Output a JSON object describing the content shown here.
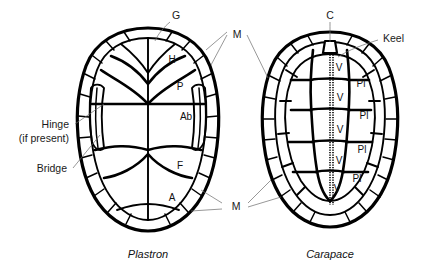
{
  "figure": {
    "background_color": "#ffffff",
    "line_color": "#000000",
    "leader_color": "#6b6b6b"
  },
  "captions": {
    "left": "Plastron",
    "right": "Carapace"
  },
  "left_labels": {
    "hinge_line1": "Hinge",
    "hinge_line2": "(if present)",
    "bridge": "Bridge"
  },
  "top_labels": {
    "gular": "G",
    "cervical": "C",
    "keel": "Keel"
  },
  "marginal_labels": {
    "top": "M",
    "bottom": "M"
  },
  "plastron_scutes": [
    {
      "code": "H",
      "name": "humeral"
    },
    {
      "code": "P",
      "name": "pectoral"
    },
    {
      "code": "Ab",
      "name": "abdominal"
    },
    {
      "code": "F",
      "name": "femoral"
    },
    {
      "code": "A",
      "name": "anal"
    }
  ],
  "carapace_vertebrals": [
    {
      "code": "V",
      "name": "vertebral-1"
    },
    {
      "code": "V",
      "name": "vertebral-2"
    },
    {
      "code": "V",
      "name": "vertebral-3"
    },
    {
      "code": "V",
      "name": "vertebral-4"
    },
    {
      "code": "V",
      "name": "vertebral-5"
    }
  ],
  "carapace_pleurals": [
    {
      "code": "Pl",
      "name": "pleural-1"
    },
    {
      "code": "Pl",
      "name": "pleural-2"
    },
    {
      "code": "Pl",
      "name": "pleural-3"
    },
    {
      "code": "Pl",
      "name": "pleural-4"
    }
  ]
}
